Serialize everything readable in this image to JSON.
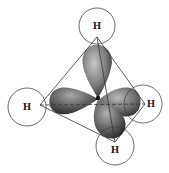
{
  "diagram": {
    "atoms": [
      {
        "id": "h-top",
        "label": "H"
      },
      {
        "id": "h-left",
        "label": "H"
      },
      {
        "id": "h-right",
        "label": "H"
      },
      {
        "id": "h-bottom",
        "label": "H"
      }
    ],
    "colors": {
      "lobe_dark": "#2a2a2a",
      "lobe_light": "#b0b0b0",
      "line": "#333333",
      "background": "#ffffff"
    }
  }
}
